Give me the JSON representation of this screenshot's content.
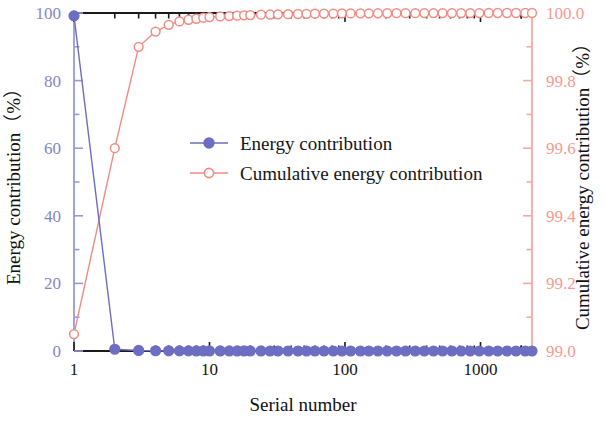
{
  "chart_data": {
    "type": "line",
    "title": "",
    "xlabel": "Serial number",
    "ylabel": "Energy contribution（%）",
    "y2label": "Cumulative energy contribution（%）",
    "xscale": "log",
    "xlim": [
      1,
      2400
    ],
    "ylim": [
      0,
      100
    ],
    "y2lim": [
      99.0,
      100.0
    ],
    "xticks": [
      1,
      10,
      100,
      1000
    ],
    "xticklabels": [
      "1",
      "10",
      "100",
      "1000"
    ],
    "yticks": [
      0,
      20,
      40,
      60,
      80,
      100
    ],
    "yticklabels": [
      "0",
      "20",
      "40",
      "60",
      "80",
      "100"
    ],
    "y2ticks": [
      99.0,
      99.2,
      99.4,
      99.6,
      99.8,
      100.0
    ],
    "y2ticklabels": [
      "99.0",
      "99.2",
      "99.4",
      "99.6",
      "99.8",
      "100.0"
    ],
    "grid": false,
    "legend_position": "center",
    "colors": {
      "energy": "#6d6dc2",
      "cumulative": "#f28b82",
      "axis_black": "#1a1a1a",
      "axis_left": "#8686c8",
      "axis_right": "#f79a90"
    },
    "series": [
      {
        "name": "Energy contribution",
        "axis": "left",
        "marker": "filled-circle",
        "color": "#6d6dc2",
        "x": [
          1,
          2,
          3,
          4,
          5,
          6,
          7,
          8,
          9,
          10,
          12,
          14,
          16,
          18,
          20,
          24,
          28,
          32,
          38,
          45,
          52,
          60,
          70,
          82,
          95,
          110,
          130,
          150,
          175,
          205,
          240,
          280,
          330,
          385,
          450,
          525,
          615,
          720,
          840,
          980,
          1150,
          1340,
          1570,
          1830,
          2140,
          2400
        ],
        "y": [
          99.15,
          0.52,
          0.16,
          0.07,
          0.05,
          0.04,
          0.03,
          0.025,
          0.02,
          0.018,
          0.015,
          0.013,
          0.011,
          0.01,
          0.009,
          0.008,
          0.007,
          0.006,
          0.005,
          0.005,
          0.004,
          0.004,
          0.003,
          0.003,
          0.003,
          0.002,
          0.002,
          0.002,
          0.002,
          0.001,
          0.001,
          0.001,
          0.001,
          0.001,
          0.001,
          0.001,
          0.001,
          0.001,
          0.0,
          0.0,
          0.0,
          0.0,
          0.0,
          0.0,
          0.0,
          0.0
        ]
      },
      {
        "name": "Cumulative energy contribution",
        "axis": "right",
        "marker": "open-circle",
        "color": "#f28b82",
        "x": [
          1,
          2,
          3,
          4,
          5,
          6,
          7,
          8,
          9,
          10,
          12,
          14,
          16,
          18,
          20,
          24,
          28,
          32,
          38,
          45,
          52,
          60,
          70,
          82,
          95,
          110,
          130,
          150,
          175,
          205,
          240,
          280,
          330,
          385,
          450,
          525,
          615,
          720,
          840,
          980,
          1150,
          1340,
          1570,
          1830,
          2140,
          2400
        ],
        "y": [
          99.05,
          99.6,
          99.9,
          99.945,
          99.965,
          99.975,
          99.98,
          99.983,
          99.986,
          99.988,
          99.99,
          99.991,
          99.992,
          99.993,
          99.994,
          99.995,
          99.9955,
          99.996,
          99.9965,
          99.997,
          99.9975,
          99.998,
          99.9982,
          99.9984,
          99.9986,
          99.9988,
          99.999,
          99.9991,
          99.9992,
          99.9993,
          99.9994,
          99.9995,
          99.9996,
          99.9997,
          99.9997,
          99.9998,
          99.9998,
          99.9999,
          99.9999,
          99.9999,
          100.0,
          100.0,
          100.0,
          100.0,
          100.0,
          100.0
        ]
      }
    ],
    "legend": [
      {
        "label": "Energy contribution",
        "marker": "filled-circle",
        "color": "#6d6dc2"
      },
      {
        "label": "Cumulative energy contribution",
        "marker": "open-circle",
        "color": "#f28b82"
      }
    ]
  }
}
